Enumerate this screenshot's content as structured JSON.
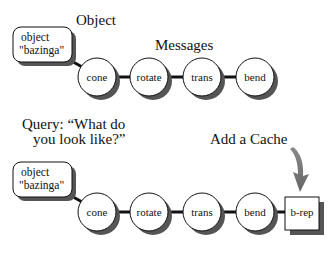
{
  "top": {
    "object_label": "Object",
    "messages_label": "Messages",
    "object_box": {
      "line1": "object",
      "line2": "\"bazinga\""
    },
    "nodes": [
      "cone",
      "rotate",
      "trans",
      "bend"
    ]
  },
  "bottom": {
    "query_line1": "Query: “What do",
    "query_line2": "you look like?”",
    "cache_label": "Add a Cache",
    "object_box": {
      "line1": "object",
      "line2": "\"bazinga\""
    },
    "nodes": [
      "cone",
      "rotate",
      "trans",
      "bend"
    ],
    "cache_node": "b-rep"
  },
  "colors": {
    "stroke": "#111111",
    "shadow": "#555555",
    "arrow": "#777777",
    "fill": "#ffffff"
  }
}
